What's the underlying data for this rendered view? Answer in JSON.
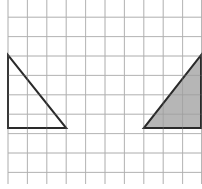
{
  "diagram": {
    "type": "grid-transformation",
    "grid": {
      "columns": 10,
      "rows": 9.5,
      "cell_size_px": 19.4,
      "origin_x": 8,
      "line_color": "#c8c8c8",
      "background": "#ffffff"
    },
    "shapes": [
      {
        "name": "original-triangle",
        "filled": false,
        "vertices_grid": [
          [
            0,
            3
          ],
          [
            0,
            7
          ],
          [
            3,
            7
          ]
        ],
        "stroke": "#2a2a2a",
        "fill": "none"
      },
      {
        "name": "reflected-triangle",
        "filled": true,
        "vertices_grid": [
          [
            7,
            7
          ],
          [
            10,
            7
          ],
          [
            10,
            3
          ]
        ],
        "stroke": "#2a2a2a",
        "fill": "#a9a9a9"
      }
    ]
  }
}
